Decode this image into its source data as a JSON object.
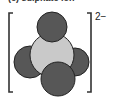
{
  "diagram": {
    "caption": "(c) sulphate ion",
    "charge_label": "2−",
    "molecule": {
      "name": "sulphate ion",
      "formula": "SO4 2-",
      "central_atom": {
        "element": "S",
        "color": "#c8c8c8",
        "cx": 52,
        "cy": 55,
        "r": 22
      },
      "outer_atoms": [
        {
          "element": "O",
          "position": "top",
          "color": "#555555",
          "cx": 52,
          "cy": 27,
          "r": 15
        },
        {
          "element": "O",
          "position": "left",
          "color": "#555555",
          "cx": 30,
          "cy": 62,
          "r": 16
        },
        {
          "element": "O",
          "position": "right",
          "color": "#555555",
          "cx": 75,
          "cy": 62,
          "r": 14
        },
        {
          "element": "O",
          "position": "bottom",
          "color": "#555555",
          "cx": 58,
          "cy": 79,
          "r": 17
        }
      ]
    },
    "brackets": {
      "color": "#333333"
    }
  }
}
